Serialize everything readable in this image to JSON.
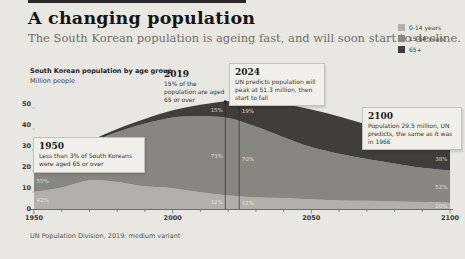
{
  "header": {
    "title": "A changing population",
    "subtitle": "The South Korean population is ageing fast, and will soon start to decline."
  },
  "legend": {
    "items": [
      {
        "label": "65+",
        "color": "#3f3e3b"
      },
      {
        "label": "15-64 years",
        "color": "#878681"
      },
      {
        "label": "0-14 years",
        "color": "#b2b0aa"
      }
    ]
  },
  "chart_header": {
    "title": "South Korean population by age group",
    "subtitle": "Million people"
  },
  "annotations": {
    "y1950": {
      "year": "1950",
      "text": "Less than 3% of South Koreans were aged 65 or over"
    },
    "y2019": {
      "year": "2019",
      "text": "15% of the population are aged 65 or over"
    },
    "y2024": {
      "year": "2024",
      "text": "UN predicts population will peak at 51.3 million, then start to fall"
    },
    "y2100": {
      "year": "2100",
      "text": "Population 29.5 million, UN predicts, the same as it was in 1966"
    }
  },
  "footer": {
    "source": "UN Population Division, 2019: medium variant"
  },
  "chart_data": {
    "type": "area",
    "stacked": true,
    "title": "South Korean population by age group",
    "ylabel": "Million people",
    "xlabel": "",
    "ylim": [
      0,
      50
    ],
    "y_ticks": [
      0,
      10,
      20,
      30,
      40,
      50
    ],
    "x_major_ticks": [
      1950,
      2000,
      2050,
      2100
    ],
    "x_minor_step": 10,
    "grid": false,
    "legend_position": "top-right",
    "x": [
      1950,
      1960,
      1970,
      1980,
      1990,
      2000,
      2010,
      2020,
      2030,
      2040,
      2050,
      2060,
      2070,
      2080,
      2090,
      2100
    ],
    "series": [
      {
        "name": "0-14 years",
        "color": "#b2b0aa",
        "values": [
          8.1,
          10.2,
          13.7,
          12.9,
          10.8,
          9.9,
          8.0,
          6.4,
          5.5,
          5.3,
          4.6,
          4.1,
          3.9,
          3.6,
          3.3,
          2.9
        ]
      },
      {
        "name": "15-64 years",
        "color": "#878681",
        "values": [
          10.6,
          14.0,
          17.5,
          23.7,
          29.9,
          33.7,
          36.2,
          37.0,
          33.8,
          28.9,
          24.9,
          22.2,
          19.9,
          18.1,
          16.3,
          15.4
        ]
      },
      {
        "name": "65+",
        "color": "#3f3e3b",
        "values": [
          0.6,
          0.9,
          1.0,
          1.5,
          2.2,
          3.4,
          5.4,
          7.9,
          11.9,
          15.7,
          17.9,
          17.7,
          16.4,
          14.8,
          13.3,
          11.2
        ]
      }
    ],
    "marker_years": [
      2019,
      2024
    ],
    "share_labels": [
      {
        "year": 1950,
        "anchor": "start",
        "labels": [
          {
            "series": 0,
            "text": "42%"
          },
          {
            "series": 1,
            "text": "55%"
          }
        ]
      },
      {
        "year": 2019,
        "anchor": "end",
        "labels": [
          {
            "series": 0,
            "text": "12%"
          },
          {
            "series": 1,
            "text": "73%"
          },
          {
            "series": 2,
            "text": "15%"
          }
        ]
      },
      {
        "year": 2024,
        "anchor": "start",
        "labels": [
          {
            "series": 0,
            "text": "11%"
          },
          {
            "series": 1,
            "text": "70%"
          },
          {
            "series": 2,
            "text": "19%"
          }
        ]
      },
      {
        "year": 2100,
        "anchor": "end",
        "labels": [
          {
            "series": 0,
            "text": "10%"
          },
          {
            "series": 1,
            "text": "52%"
          },
          {
            "series": 2,
            "text": "38%"
          }
        ]
      }
    ]
  }
}
